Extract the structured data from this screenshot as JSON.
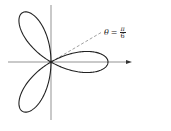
{
  "diagram": {
    "title": "",
    "curve": "r = cos(3θ)",
    "petals": 3,
    "origin": {
      "x": 51,
      "y": 62
    },
    "radius_px": 57,
    "line_color": "#222222",
    "axis_color": "#666666",
    "dashed_ray": {
      "angle": "π/6",
      "color": "#777777"
    },
    "label": {
      "theta": "θ",
      "eq": "=",
      "num": "π",
      "den": "6"
    }
  }
}
